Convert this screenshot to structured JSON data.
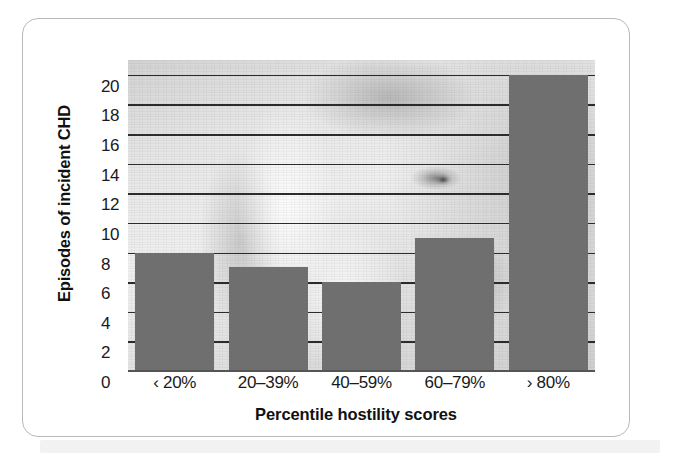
{
  "chart_data": {
    "type": "bar",
    "title": "",
    "subtitle": "",
    "xlabel": "Percentile hostility scores",
    "ylabel": "Episodes of incident CHD",
    "categories": [
      "‹ 20%",
      "20–39%",
      "40–59%",
      "60–79%",
      "› 80%"
    ],
    "values": [
      8,
      7,
      6,
      9,
      20
    ],
    "series": [
      {
        "name": "Episodes of incident CHD",
        "values": [
          8,
          7,
          6,
          9,
          20
        ]
      }
    ],
    "ylim": [
      0,
      21
    ],
    "xlim": [
      0,
      5
    ],
    "y_ticks": [
      0,
      2,
      4,
      6,
      8,
      10,
      12,
      14,
      16,
      18,
      20
    ],
    "y_tick_labels": [
      "0",
      "2",
      "4",
      "6",
      "8",
      "10",
      "12",
      "14",
      "16",
      "18",
      "20"
    ],
    "grid": true,
    "grid_axis": "y",
    "legend": false,
    "legend_position": "none",
    "bar_color": "#6f6f6f",
    "gridline_color": "#2b2b2b",
    "plot_background": "grayscale-face-photograph",
    "annotations": []
  },
  "figure": {
    "border_color": "#b9b9b9",
    "background_color": "#ffffff",
    "shadow_band_color": "#f2f2f2"
  }
}
